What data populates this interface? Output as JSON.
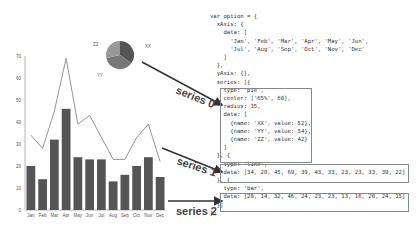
{
  "code": {
    "lines": [
      "var option = {",
      "  xAxis: {",
      "    data: [",
      "      'Jan', 'Feb', 'Mar', 'Apr', 'May', 'Jun',",
      "      'Jul', 'Aug', 'Sep', 'Oct', 'Nov', 'Dec'",
      "    ]",
      "  },",
      "  yAxis: {},",
      "  series: [{",
      "    type: 'pie',",
      "    center: ['65%', 60],",
      "    radius: 35,",
      "    data: [",
      "      {name: 'XX', value: 52},",
      "      {name: 'YY', value: 54},",
      "      {name: 'ZZ', value: 42}",
      "    ]",
      "  }, {",
      "    type: 'line',",
      "    data: [34, 28, 45, 69, 39, 43, 33, 23, 23, 33, 39, 22]",
      "  }, {",
      "    type: 'bar',",
      "    data: [20, 14, 32, 46, 24, 23, 23, 13, 16, 20, 24, 15]",
      "  }]",
      "};"
    ]
  },
  "annotations": {
    "series0": "series 0",
    "series1": "series 1",
    "series2": "series 2"
  },
  "chart_data": [
    {
      "type": "bar",
      "categories": [
        "Jan",
        "Feb",
        "Mar",
        "Apr",
        "May",
        "Jun",
        "Jul",
        "Aug",
        "Sep",
        "Oct",
        "Nov",
        "Dec"
      ],
      "series": [
        {
          "name": "series 2 (bar)",
          "values": [
            20,
            14,
            32,
            46,
            24,
            23,
            23,
            13,
            16,
            20,
            24,
            15
          ]
        },
        {
          "name": "series 1 (line)",
          "type": "line",
          "values": [
            34,
            28,
            45,
            69,
            39,
            43,
            33,
            23,
            23,
            33,
            39,
            22
          ]
        }
      ],
      "yticks": [
        0,
        10,
        20,
        30,
        40,
        50,
        60,
        70
      ],
      "ylim": [
        0,
        70
      ]
    },
    {
      "type": "pie",
      "labels": [
        "XX",
        "YY",
        "ZZ"
      ],
      "values": [
        52,
        54,
        42
      ]
    }
  ],
  "colors": {
    "bar": "#555555",
    "line": "#888888",
    "pie_xx": "#555555",
    "pie_yy": "#777777",
    "pie_zz": "#999999"
  }
}
